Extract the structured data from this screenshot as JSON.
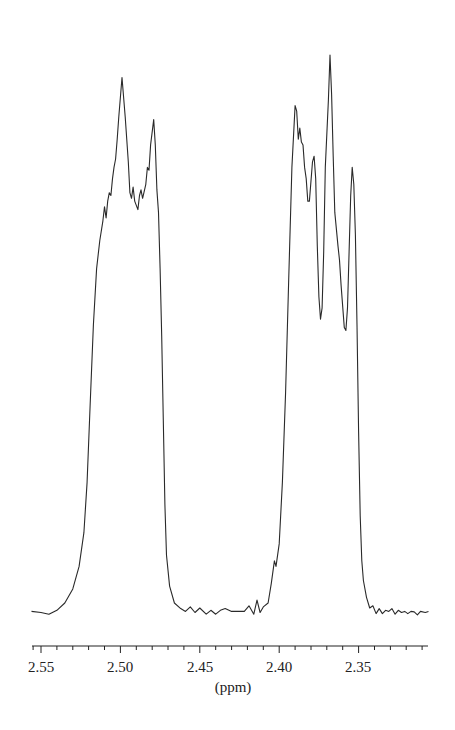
{
  "chart_data": {
    "type": "line",
    "title": "",
    "xlabel": "(ppm)",
    "ylabel": "",
    "xlim": [
      2.556,
      2.306
    ],
    "x_reversed": true,
    "grid": false,
    "legend": null,
    "x_ticks_major": [
      2.55,
      2.5,
      2.45,
      2.4,
      2.35
    ],
    "x_tick_labels": [
      "2.55",
      "2.50",
      "2.45",
      "2.40",
      "2.35"
    ],
    "x_minor_tick_step": 0.01,
    "y_axis_visible": false,
    "y_units": "relative intensity (0 = baseline, 100 = tallest peak)",
    "series": [
      {
        "name": "1H NMR spectrum",
        "color": "#2a2a2a",
        "points": [
          [
            2.556,
            1.0
          ],
          [
            2.55,
            0.8
          ],
          [
            2.545,
            0.5
          ],
          [
            2.54,
            1.2
          ],
          [
            2.535,
            2.5
          ],
          [
            2.53,
            5.0
          ],
          [
            2.526,
            9.0
          ],
          [
            2.523,
            15.0
          ],
          [
            2.521,
            24.0
          ],
          [
            2.519,
            38.0
          ],
          [
            2.517,
            52.0
          ],
          [
            2.515,
            62.0
          ],
          [
            2.513,
            67.0
          ],
          [
            2.511,
            70.5
          ],
          [
            2.51,
            73.0
          ],
          [
            2.509,
            71.0
          ],
          [
            2.508,
            74.0
          ],
          [
            2.507,
            75.5
          ],
          [
            2.506,
            75.0
          ],
          [
            2.505,
            78.0
          ],
          [
            2.504,
            80.0
          ],
          [
            2.503,
            81.5
          ],
          [
            2.502,
            85.0
          ],
          [
            2.501,
            89.0
          ],
          [
            2.499,
            96.0
          ],
          [
            2.497,
            89.0
          ],
          [
            2.495,
            81.0
          ],
          [
            2.494,
            75.5
          ],
          [
            2.493,
            74.5
          ],
          [
            2.492,
            76.5
          ],
          [
            2.491,
            74.0
          ],
          [
            2.489,
            72.5
          ],
          [
            2.488,
            75.0
          ],
          [
            2.487,
            76.0
          ],
          [
            2.486,
            74.5
          ],
          [
            2.484,
            77.0
          ],
          [
            2.483,
            80.0
          ],
          [
            2.482,
            79.5
          ],
          [
            2.481,
            84.0
          ],
          [
            2.479,
            88.5
          ],
          [
            2.478,
            84.0
          ],
          [
            2.477,
            76.0
          ],
          [
            2.476,
            72.0
          ],
          [
            2.475,
            62.0
          ],
          [
            2.474,
            50.0
          ],
          [
            2.473,
            35.0
          ],
          [
            2.472,
            20.0
          ],
          [
            2.471,
            11.0
          ],
          [
            2.469,
            5.5
          ],
          [
            2.466,
            2.5
          ],
          [
            2.462,
            1.5
          ],
          [
            2.459,
            1.0
          ],
          [
            2.456,
            1.8
          ],
          [
            2.453,
            0.8
          ],
          [
            2.45,
            1.6
          ],
          [
            2.446,
            0.5
          ],
          [
            2.443,
            1.2
          ],
          [
            2.44,
            0.5
          ],
          [
            2.437,
            1.2
          ],
          [
            2.434,
            1.5
          ],
          [
            2.43,
            1.0
          ],
          [
            2.425,
            1.0
          ],
          [
            2.422,
            1.0
          ],
          [
            2.419,
            2.0
          ],
          [
            2.416,
            0.5
          ],
          [
            2.414,
            3.0
          ],
          [
            2.412,
            0.8
          ],
          [
            2.41,
            1.8
          ],
          [
            2.407,
            2.5
          ],
          [
            2.405,
            6.0
          ],
          [
            2.403,
            10.0
          ],
          [
            2.402,
            9.0
          ],
          [
            2.4,
            13.0
          ],
          [
            2.398,
            24.0
          ],
          [
            2.396,
            40.0
          ],
          [
            2.394,
            60.0
          ],
          [
            2.392,
            80.0
          ],
          [
            2.39,
            91.0
          ],
          [
            2.389,
            90.0
          ],
          [
            2.388,
            85.0
          ],
          [
            2.387,
            87.0
          ],
          [
            2.386,
            84.5
          ],
          [
            2.385,
            84.0
          ],
          [
            2.384,
            80.0
          ],
          [
            2.383,
            78.0
          ],
          [
            2.382,
            74.0
          ],
          [
            2.381,
            74.0
          ],
          [
            2.379,
            81.0
          ],
          [
            2.378,
            82.0
          ],
          [
            2.377,
            78.0
          ],
          [
            2.376,
            66.0
          ],
          [
            2.375,
            57.0
          ],
          [
            2.374,
            53.0
          ],
          [
            2.373,
            55.0
          ],
          [
            2.372,
            65.0
          ],
          [
            2.371,
            80.0
          ],
          [
            2.369,
            92.0
          ],
          [
            2.368,
            100.0
          ],
          [
            2.367,
            93.0
          ],
          [
            2.366,
            82.0
          ],
          [
            2.365,
            72.0
          ],
          [
            2.363,
            66.0
          ],
          [
            2.362,
            63.5
          ],
          [
            2.361,
            59.0
          ],
          [
            2.359,
            51.5
          ],
          [
            2.358,
            51.0
          ],
          [
            2.357,
            55.0
          ],
          [
            2.356,
            65.0
          ],
          [
            2.355,
            75.0
          ],
          [
            2.354,
            80.0
          ],
          [
            2.353,
            77.0
          ],
          [
            2.352,
            68.0
          ],
          [
            2.351,
            52.0
          ],
          [
            2.35,
            33.0
          ],
          [
            2.349,
            18.0
          ],
          [
            2.348,
            10.0
          ],
          [
            2.347,
            6.5
          ],
          [
            2.345,
            3.5
          ],
          [
            2.343,
            1.6
          ],
          [
            2.341,
            2.0
          ],
          [
            2.339,
            0.6
          ],
          [
            2.337,
            1.5
          ],
          [
            2.335,
            0.6
          ],
          [
            2.333,
            1.2
          ],
          [
            2.331,
            1.0
          ],
          [
            2.329,
            1.5
          ],
          [
            2.327,
            0.5
          ],
          [
            2.325,
            1.2
          ],
          [
            2.323,
            0.8
          ],
          [
            2.321,
            1.0
          ],
          [
            2.319,
            0.6
          ],
          [
            2.317,
            1.0
          ],
          [
            2.315,
            0.9
          ],
          [
            2.313,
            0.4
          ],
          [
            2.311,
            1.0
          ],
          [
            2.308,
            0.8
          ],
          [
            2.306,
            1.0
          ]
        ]
      }
    ],
    "peaks": [
      {
        "ppm": 2.499,
        "rel_intensity": 96,
        "group": "left multiplet"
      },
      {
        "ppm": 2.479,
        "rel_intensity": 88.5,
        "group": "left multiplet"
      },
      {
        "ppm": 2.51,
        "rel_intensity": 73,
        "group": "left multiplet shoulder"
      },
      {
        "ppm": 2.39,
        "rel_intensity": 91,
        "group": "right multiplet"
      },
      {
        "ppm": 2.379,
        "rel_intensity": 82,
        "group": "right multiplet"
      },
      {
        "ppm": 2.368,
        "rel_intensity": 100,
        "group": "right multiplet"
      },
      {
        "ppm": 2.354,
        "rel_intensity": 80,
        "group": "right multiplet"
      }
    ]
  },
  "axis": {
    "title": "(ppm)",
    "labels": [
      "2.55",
      "2.50",
      "2.45",
      "2.40",
      "2.35"
    ]
  }
}
